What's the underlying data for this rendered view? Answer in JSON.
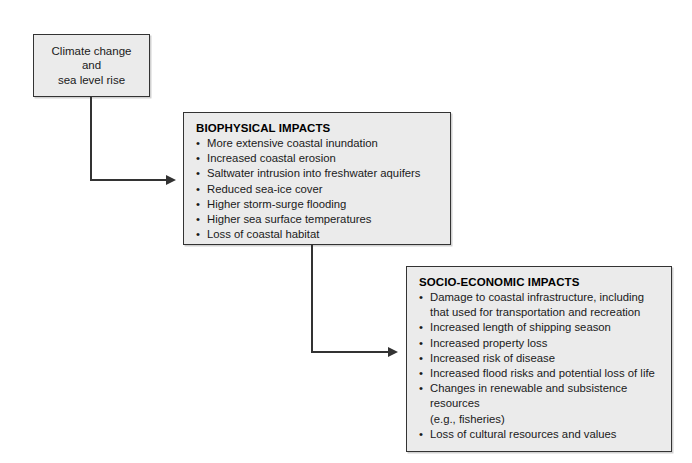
{
  "diagram": {
    "colors": {
      "box_fill": "#ebebeb",
      "box_border": "#333333",
      "text": "#1a1a1a",
      "connector": "#333333",
      "background": "#ffffff"
    },
    "source_box": {
      "line1": "Climate change",
      "line2": "and",
      "line3": "sea level rise"
    },
    "biophysical_box": {
      "heading": "BIOPHYSICAL IMPACTS",
      "items": [
        "More extensive coastal inundation",
        "Increased coastal erosion",
        "Saltwater intrusion into freshwater aquifers",
        "Reduced sea-ice cover",
        "Higher storm-surge flooding",
        "Higher sea surface temperatures",
        "Loss of coastal habitat"
      ]
    },
    "socioeconomic_box": {
      "heading": "SOCIO-ECONOMIC IMPACTS",
      "items": [
        {
          "text": "Damage to coastal infrastructure, including",
          "continuation": "that used for transportation and recreation"
        },
        {
          "text": "Increased length of shipping season",
          "continuation": ""
        },
        {
          "text": "Increased property loss",
          "continuation": ""
        },
        {
          "text": "Increased risk of disease",
          "continuation": ""
        },
        {
          "text": "Increased flood risks and potential loss of life",
          "continuation": ""
        },
        {
          "text": "Changes in renewable and subsistence resources",
          "continuation": "(e.g., fisheries)"
        },
        {
          "text": "Loss of cultural resources and values",
          "continuation": ""
        }
      ]
    },
    "bullet_glyph": "•",
    "connectors": [
      {
        "name": "source-to-biophysical",
        "from": "source_box",
        "to": "biophysical_box"
      },
      {
        "name": "biophysical-to-socioeconomic",
        "from": "biophysical_box",
        "to": "socioeconomic_box"
      }
    ]
  }
}
